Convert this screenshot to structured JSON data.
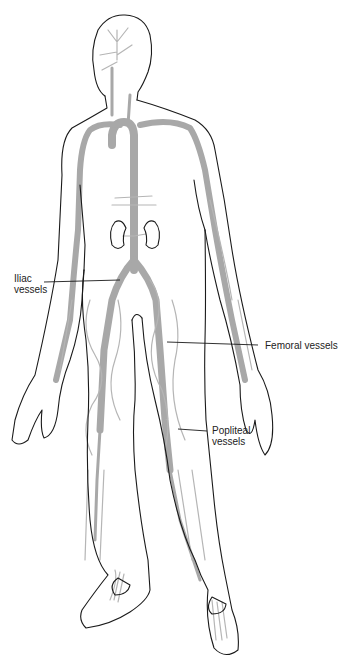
{
  "diagram": {
    "colors": {
      "outline": "#1a1a1a",
      "vessels": "#a8a8a8",
      "background": "#ffffff"
    },
    "labels": [
      {
        "id": "iliac",
        "line1": "Iliac",
        "line2": "vessels"
      },
      {
        "id": "femoral",
        "line1": "Femoral vessels"
      },
      {
        "id": "popliteal",
        "line1": "Popliteal",
        "line2": "vessels"
      }
    ]
  }
}
